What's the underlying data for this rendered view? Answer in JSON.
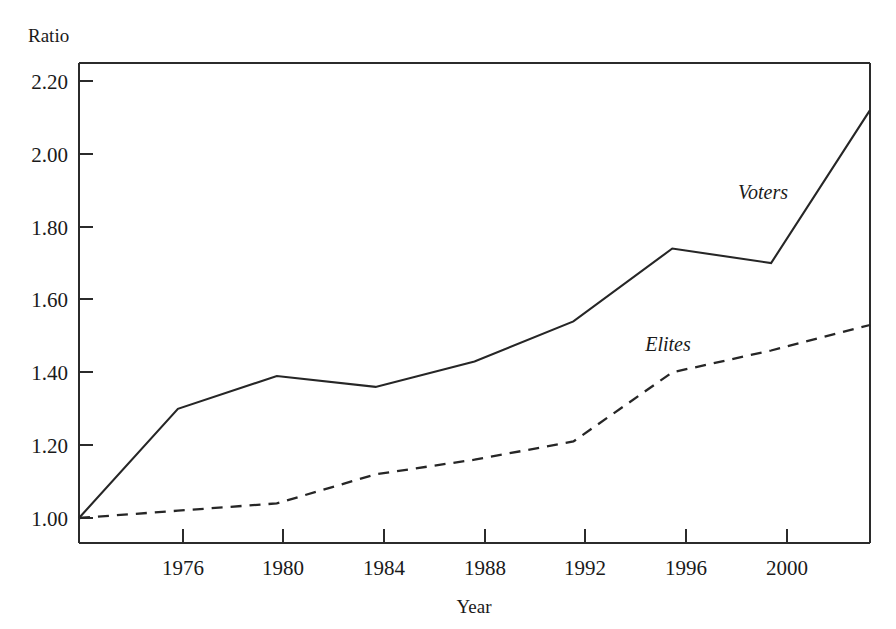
{
  "chart_data": {
    "type": "line",
    "title": "",
    "xlabel": "Year",
    "ylabel": "Ratio",
    "x": [
      1972,
      1976,
      1980,
      1984,
      1988,
      1992,
      1996,
      2000,
      2004
    ],
    "xlim": [
      1972,
      2004
    ],
    "ylim": [
      0.92,
      2.28
    ],
    "grid": false,
    "legend_position": "inline-annotations",
    "xticks": [
      1976,
      1980,
      1984,
      1988,
      1992,
      1996,
      2000
    ],
    "xtick_labels": [
      "1976",
      "1980",
      "1984",
      "1988",
      "1992",
      "1996",
      "2000"
    ],
    "yticks": [
      1.0,
      1.2,
      1.4,
      1.6,
      1.8,
      2.0,
      2.2
    ],
    "ytick_labels": [
      "1.00",
      "1.20",
      "1.40",
      "1.60",
      "1.80",
      "2.00",
      "2.20"
    ],
    "series": [
      {
        "name": "Voters",
        "style": "solid",
        "values": [
          1.0,
          1.3,
          1.39,
          1.36,
          1.43,
          1.54,
          1.74,
          1.7,
          2.12
        ]
      },
      {
        "name": "Elites",
        "style": "dashed",
        "values": [
          1.0,
          1.02,
          1.04,
          1.12,
          1.16,
          1.21,
          1.4,
          1.46,
          1.53
        ]
      }
    ],
    "annotations": [
      {
        "text": "Voters",
        "x": 1996,
        "y": 1.86
      },
      {
        "text": "Elites",
        "x": 1993,
        "y": 1.5
      }
    ],
    "colors": {
      "line": "#262626",
      "axis": "#2b2b2b",
      "background": "#ffffff",
      "text": "#1a1a1a"
    }
  }
}
